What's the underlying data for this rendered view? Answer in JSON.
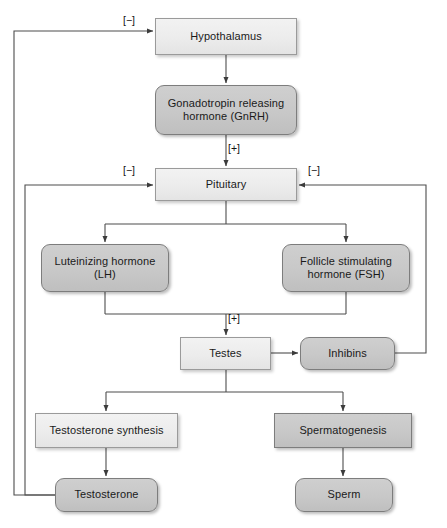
{
  "diagram": {
    "colors": {
      "light_fill": "#ececec",
      "dark_fill": "#c8c8c8",
      "light_stroke": "#9a9a9a",
      "dark_stroke": "#7d7d7d",
      "line": "#4d4d4d",
      "text": "#1a1a1a",
      "background": "#ffffff"
    },
    "nodes": [
      {
        "id": "hypothalamus",
        "label": "Hypothalamus",
        "style": "light",
        "shape": "square",
        "x": 155,
        "y": 18,
        "w": 142,
        "h": 37
      },
      {
        "id": "gnrh",
        "label": "Gonadotropin releasing hormone (GnRH)",
        "style": "dark",
        "shape": "round",
        "x": 155,
        "y": 85,
        "w": 142,
        "h": 50
      },
      {
        "id": "pituitary",
        "label": "Pituitary",
        "style": "light",
        "shape": "square",
        "x": 155,
        "y": 168,
        "w": 142,
        "h": 33
      },
      {
        "id": "lh",
        "label": "Luteinizing hormone (LH)",
        "style": "dark",
        "shape": "round",
        "x": 41,
        "y": 244,
        "w": 128,
        "h": 48
      },
      {
        "id": "fsh",
        "label": "Follicle stimulating hormone (FSH)",
        "style": "dark",
        "shape": "round",
        "x": 282,
        "y": 244,
        "w": 128,
        "h": 48
      },
      {
        "id": "testes",
        "label": "Testes",
        "style": "light",
        "shape": "square",
        "x": 180,
        "y": 337,
        "w": 91,
        "h": 33
      },
      {
        "id": "inhibins",
        "label": "Inhibins",
        "style": "dark",
        "shape": "round",
        "x": 300,
        "y": 337,
        "w": 95,
        "h": 33
      },
      {
        "id": "testosterone-synthesis",
        "label": "Testosterone synthesis",
        "style": "light",
        "shape": "square",
        "x": 35,
        "y": 413,
        "w": 143,
        "h": 35
      },
      {
        "id": "spermatogenesis",
        "label": "Spermatogenesis",
        "style": "dark",
        "shape": "square",
        "x": 274,
        "y": 413,
        "w": 138,
        "h": 35
      },
      {
        "id": "testosterone",
        "label": "Testosterone",
        "style": "dark",
        "shape": "round",
        "x": 55,
        "y": 478,
        "w": 103,
        "h": 34
      },
      {
        "id": "sperm",
        "label": "Sperm",
        "style": "dark",
        "shape": "round",
        "x": 295,
        "y": 478,
        "w": 98,
        "h": 34
      }
    ],
    "sign_labels": [
      {
        "id": "neg-hypothalamus",
        "text": "[−]",
        "x": 123,
        "y": 14
      },
      {
        "id": "pos-gnrh-pituitary",
        "text": "[+]",
        "x": 228,
        "y": 142
      },
      {
        "id": "neg-pituitary-left",
        "text": "[−]",
        "x": 123,
        "y": 164
      },
      {
        "id": "neg-pituitary-right",
        "text": "[−]",
        "x": 308,
        "y": 164
      },
      {
        "id": "pos-gonadotropins-testes",
        "text": "[+]",
        "x": 228,
        "y": 312
      }
    ],
    "edges": [
      {
        "id": "hypothalamus-to-gnrh",
        "from": "hypothalamus",
        "to": "gnrh",
        "kind": "arrow"
      },
      {
        "id": "gnrh-to-pituitary",
        "from": "gnrh",
        "to": "pituitary",
        "kind": "arrow",
        "sign": "[+]"
      },
      {
        "id": "pituitary-to-lh",
        "from": "pituitary",
        "to": "lh",
        "kind": "arrow"
      },
      {
        "id": "pituitary-to-fsh",
        "from": "pituitary",
        "to": "fsh",
        "kind": "arrow"
      },
      {
        "id": "lh-fsh-to-testes",
        "from": "lh, fsh",
        "to": "testes",
        "kind": "arrow",
        "sign": "[+]"
      },
      {
        "id": "testes-to-inhibins",
        "from": "testes",
        "to": "inhibins",
        "kind": "arrow"
      },
      {
        "id": "testes-to-testosterone-synthesis",
        "from": "testes",
        "to": "testosterone-synthesis",
        "kind": "arrow"
      },
      {
        "id": "testes-to-spermatogenesis",
        "from": "testes",
        "to": "spermatogenesis",
        "kind": "arrow"
      },
      {
        "id": "synthesis-to-testosterone",
        "from": "testosterone-synthesis",
        "to": "testosterone",
        "kind": "arrow"
      },
      {
        "id": "spermatogenesis-to-sperm",
        "from": "spermatogenesis",
        "to": "sperm",
        "kind": "arrow"
      },
      {
        "id": "testosterone-feedback-hypothalamus",
        "from": "testosterone",
        "to": "hypothalamus",
        "kind": "feedback",
        "sign": "[−]"
      },
      {
        "id": "testosterone-feedback-pituitary",
        "from": "testosterone",
        "to": "pituitary",
        "kind": "feedback",
        "sign": "[−]"
      },
      {
        "id": "inhibins-feedback-pituitary",
        "from": "inhibins",
        "to": "pituitary",
        "kind": "feedback",
        "sign": "[−]"
      }
    ]
  }
}
